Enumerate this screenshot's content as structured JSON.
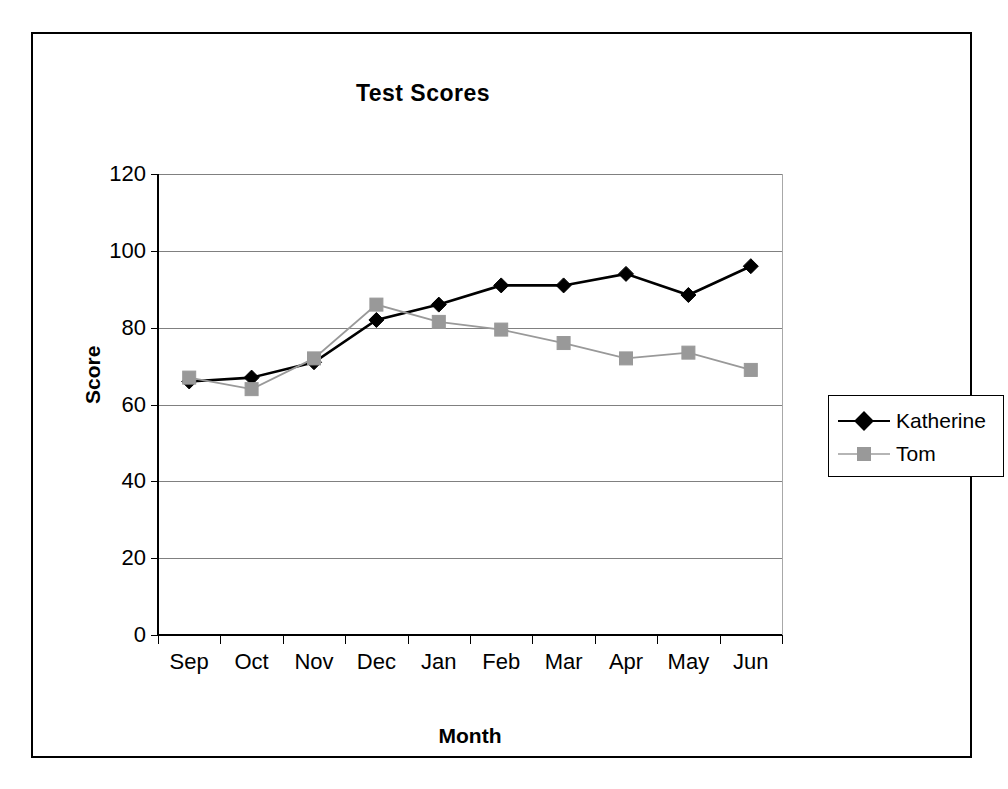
{
  "chart_data": {
    "type": "line",
    "title": "Test Scores",
    "xlabel": "Month",
    "ylabel": "Score",
    "categories": [
      "Sep",
      "Oct",
      "Nov",
      "Dec",
      "Jan",
      "Feb",
      "Mar",
      "Apr",
      "May",
      "Jun"
    ],
    "ylim": [
      0,
      120
    ],
    "yticks": [
      0,
      20,
      40,
      60,
      80,
      100,
      120
    ],
    "ytick_labels": [
      "0",
      "20",
      "40",
      "60",
      "80",
      "100",
      "120"
    ],
    "grid": "horizontal",
    "legend_position": "right",
    "series": [
      {
        "name": "Katherine",
        "color": "#000000",
        "marker": "diamond",
        "values": [
          66,
          67,
          71,
          82,
          86,
          91,
          91,
          94,
          88.5,
          96
        ]
      },
      {
        "name": "Tom",
        "color": "#999999",
        "marker": "square",
        "values": [
          67,
          64,
          72,
          86,
          81.5,
          79.5,
          76,
          72,
          73.5,
          69
        ]
      }
    ]
  },
  "legend": {
    "items": [
      {
        "label": "Katherine"
      },
      {
        "label": "Tom"
      }
    ]
  }
}
